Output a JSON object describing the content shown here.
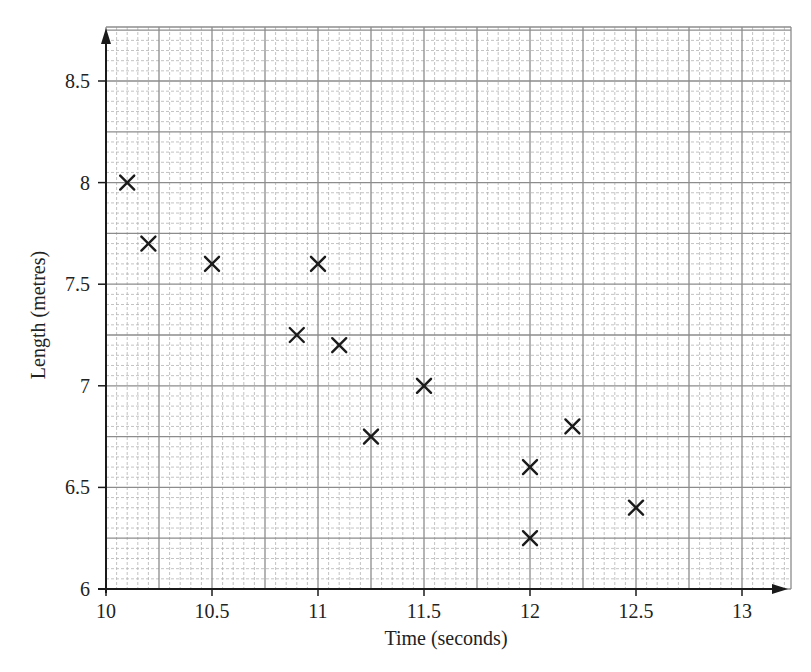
{
  "chart_data": {
    "type": "scatter",
    "title": "",
    "xlabel": "Time (seconds)",
    "ylabel": "Length (metres)",
    "xlim": [
      10,
      13.2
    ],
    "ylim": [
      6,
      8.75
    ],
    "x_ticks": [
      10,
      10.5,
      11,
      11.5,
      12,
      12.5,
      13
    ],
    "x_tick_labels": [
      "10",
      "10.5",
      "11",
      "11.5",
      "12",
      "12.5",
      "13"
    ],
    "y_ticks": [
      6,
      6.5,
      7,
      7.5,
      8,
      8.5
    ],
    "y_tick_labels": [
      "6",
      "6.5",
      "7",
      "7.5",
      "8",
      "8.5"
    ],
    "grid": {
      "on": true,
      "major_step_x": 0.25,
      "minor_step_x": 0.05,
      "major_step_y": 0.25,
      "minor_step_y": 0.05,
      "style": "graph paper"
    },
    "legend": null,
    "marker": "x",
    "points": [
      {
        "x": 10.1,
        "y": 8.0
      },
      {
        "x": 10.2,
        "y": 7.7
      },
      {
        "x": 10.5,
        "y": 7.6
      },
      {
        "x": 11.0,
        "y": 7.6
      },
      {
        "x": 10.9,
        "y": 7.25
      },
      {
        "x": 11.1,
        "y": 7.2
      },
      {
        "x": 11.25,
        "y": 6.75
      },
      {
        "x": 11.5,
        "y": 7.0
      },
      {
        "x": 12.0,
        "y": 6.6
      },
      {
        "x": 12.2,
        "y": 6.8
      },
      {
        "x": 12.0,
        "y": 6.25
      },
      {
        "x": 12.5,
        "y": 6.4
      }
    ]
  },
  "colors": {
    "axis": "#1a1a1a",
    "major_grid": "#8c8c8c",
    "minor_grid": "#b4b4b4",
    "marker": "#1a1a1a",
    "background": "#ffffff"
  },
  "layout": {
    "x0_px": 106,
    "x_px_per_unit": 212,
    "y0_px": 589,
    "y_px_per_unit": 203.2,
    "grid_left": 106,
    "grid_right": 791,
    "grid_top": 27,
    "grid_bottom": 589
  }
}
